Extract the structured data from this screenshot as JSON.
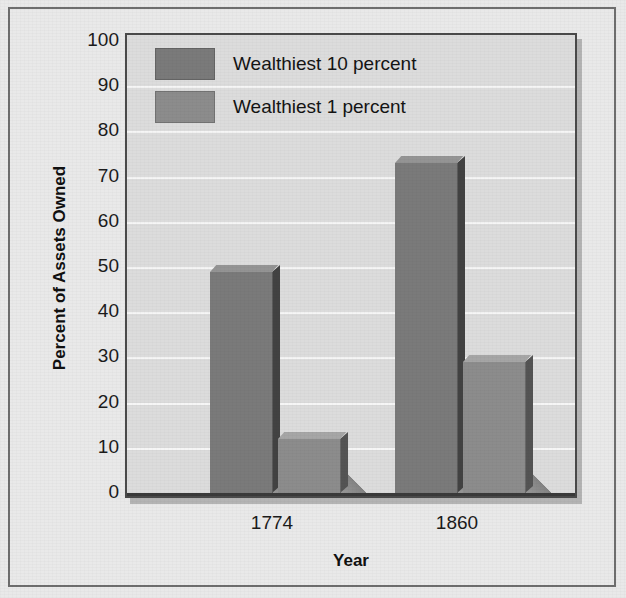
{
  "chart_data": {
    "type": "bar",
    "title": "",
    "subtitle": "",
    "xlabel": "Year",
    "ylabel": "Percent of Assets Owned",
    "categories": [
      "1774",
      "1860"
    ],
    "series": [
      {
        "name": "Wealthiest 10 percent",
        "values": [
          49,
          73
        ],
        "color": "#7a7a7a"
      },
      {
        "name": "Wealthiest 1 percent",
        "values": [
          12,
          29
        ],
        "color": "#8c8c8c"
      }
    ],
    "ylim": [
      0,
      100
    ],
    "yticks": [
      "100",
      "90",
      "80",
      "70",
      "60",
      "50",
      "40",
      "30",
      "20",
      "10",
      "0"
    ],
    "grid": true,
    "legend_position": "top-left",
    "plot_background": "#dcdcdc",
    "gridline_color": "#f6f6f6",
    "frame_color": "#4a4a4a",
    "page_background": "#e9e9e9"
  },
  "axis": {
    "y_title": "Percent of Assets Owned",
    "x_title": "Year"
  },
  "legend": {
    "items": [
      {
        "label": "Wealthiest 10 percent"
      },
      {
        "label": "Wealthiest 1 percent"
      }
    ]
  }
}
